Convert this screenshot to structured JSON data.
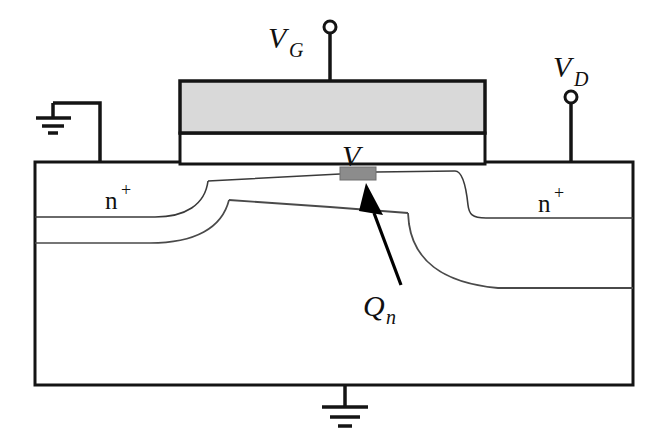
{
  "figure": {
    "type": "device-cross-section"
  },
  "colors": {
    "outline": "#141414",
    "gate_fill": "#d9d9d9",
    "oxide_fill": "#ffffff",
    "substrate_fill": "#ffffff",
    "charge_sheet_fill": "#8c8c8c",
    "junction_line": "#3a3a3a",
    "depletion_line": "#4a4a4a",
    "arrow_fill": "#000000",
    "background": "#ffffff"
  },
  "labels": {
    "gate_terminal": {
      "base": "V",
      "sub": "G",
      "x": 268,
      "y": 48
    },
    "drain_terminal": {
      "base": "V",
      "sub": "D",
      "x": 553,
      "y": 77
    },
    "channel_potential": {
      "base": "V",
      "sub": "",
      "x": 342,
      "y": 166
    },
    "inversion_charge": {
      "base": "Q",
      "sub": "n",
      "x": 363,
      "y": 316
    },
    "source_region": {
      "base": "n",
      "sup": "+",
      "x": 105,
      "y": 209
    },
    "drain_region": {
      "base": "n",
      "sup": "+",
      "x": 538,
      "y": 212
    }
  },
  "regions": {
    "gate": {
      "label": "polysilicon gate",
      "x": 180,
      "y": 81,
      "w": 305,
      "h": 52
    },
    "oxide": {
      "label": "gate oxide",
      "x": 180,
      "y": 133,
      "w": 305,
      "h": 32
    },
    "substrate": {
      "label": "p-type substrate",
      "x": 35,
      "y": 162,
      "w": 598,
      "h": 223
    },
    "charge_sheet": {
      "label": "inversion charge sheet",
      "x": 340,
      "y": 167,
      "w": 36,
      "h": 13
    }
  },
  "terminals": {
    "gate": {
      "name": "gate-terminal",
      "node_x": 330,
      "node_y": 27,
      "node_r": 6,
      "lead_from_y": 33,
      "lead_to_y": 81
    },
    "drain": {
      "name": "drain-terminal",
      "node_x": 571,
      "node_y": 97,
      "node_r": 6,
      "lead_from_y": 103,
      "lead_to_y": 162
    },
    "source_ground": {
      "name": "source-ground",
      "x": 100,
      "y": 162
    },
    "body_ground": {
      "name": "body-ground",
      "x": 345,
      "y": 385
    }
  }
}
